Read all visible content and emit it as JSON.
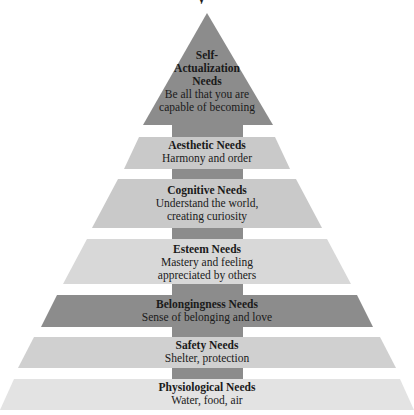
{
  "diagram": {
    "type": "pyramid",
    "title_fragment": "y",
    "colors": {
      "dark": "#8c8c8c",
      "medium": "#c9c9c9",
      "light": "#d8d8d8",
      "safety": "#d0d0d0",
      "lightest": "#e3e3e3"
    },
    "apex": {
      "name": "Self-Actualization Needs",
      "heading_lines": [
        "Self-",
        "Actualization",
        "Needs"
      ],
      "description_lines": [
        "Be all that you are",
        "capable of becoming"
      ],
      "points": "207,13 143,125 273,125",
      "color": "#8c8c8c"
    },
    "trunk": {
      "x": 172,
      "y": 118,
      "width": 71,
      "height": 282,
      "color": "#8c8c8c"
    },
    "levels": [
      {
        "name": "Aesthetic Needs",
        "description_lines": [
          "Harmony and order"
        ],
        "points": "139,137 275,137 290,169 124,169",
        "color": "#c9c9c9",
        "label_top": 139
      },
      {
        "name": "Cognitive Needs",
        "description_lines": [
          "Understand the world,",
          "creating curiosity"
        ],
        "points": "118,179 296,179 322,228 92,228",
        "color": "#c9c9c9",
        "label_top": 184
      },
      {
        "name": "Esteem Needs",
        "description_lines": [
          "Mastery and feeling",
          "appreciated by others"
        ],
        "points": "87,239 327,239 351,284 63,284",
        "color": "#d8d8d8",
        "label_top": 243
      },
      {
        "name": "Belongingness Needs",
        "description_lines": [
          "Sense of belonging and love"
        ],
        "points": "57,295 357,295 373,327 41,327",
        "color": "#8c8c8c",
        "label_top": 298
      },
      {
        "name": "Safety Needs",
        "description_lines": [
          "Shelter, protection"
        ],
        "points": "34,337 380,337 396,368 18,368",
        "color": "#d0d0d0",
        "label_top": 339
      },
      {
        "name": "Physiological Needs",
        "description_lines": [
          "Water, food, air"
        ],
        "points": "14,379 400,379 414,410 0,410",
        "color": "#e3e3e3",
        "label_top": 381
      }
    ]
  }
}
